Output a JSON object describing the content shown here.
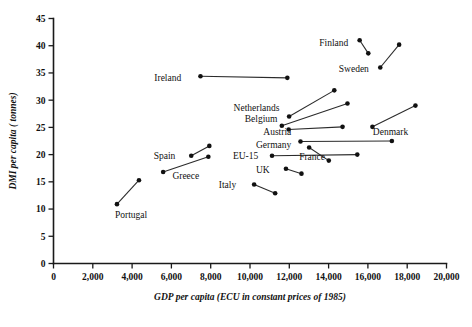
{
  "chart_data": {
    "type": "scatter",
    "title": "",
    "xlabel": "GDP per capita (ECU in constant prices of 1985)",
    "ylabel": "DMI per capita ( tonnes)",
    "xlim": [
      0,
      20000
    ],
    "ylim": [
      0,
      45
    ],
    "grid": false,
    "legend": "none",
    "xticks": [
      0,
      2000,
      4000,
      6000,
      8000,
      10000,
      12000,
      14000,
      16000,
      18000,
      20000
    ],
    "xticklabels": [
      "0",
      "2,000",
      "4,000",
      "6,000",
      "8,000",
      "10,000",
      "12,000",
      "14,000",
      "16,000",
      "18,000",
      "20,000"
    ],
    "yticks": [
      0,
      5,
      10,
      15,
      20,
      25,
      30,
      35,
      40,
      45
    ],
    "yticklabels": [
      "0",
      "5",
      "10",
      "15",
      "20",
      "25",
      "30",
      "35",
      "40",
      "45"
    ],
    "note": "Each country is drawn as a two-point segment connecting its start-year and end-year values.",
    "series": [
      {
        "name": "Finland",
        "label": "Finland",
        "label_side": "left",
        "label_x": 15000,
        "label_y": 40.6,
        "points": [
          {
            "x": 15580,
            "y": 41.0
          },
          {
            "x": 16020,
            "y": 38.6
          }
        ]
      },
      {
        "name": "Sweden",
        "label": "Sweden",
        "label_side": "left",
        "label_x": 16050,
        "label_y": 35.8,
        "points": [
          {
            "x": 16630,
            "y": 36.0
          },
          {
            "x": 17590,
            "y": 40.2
          }
        ]
      },
      {
        "name": "Ireland",
        "label": "Ireland",
        "label_side": "left",
        "label_x": 6500,
        "label_y": 34.2,
        "points": [
          {
            "x": 7480,
            "y": 34.4
          },
          {
            "x": 11900,
            "y": 34.1
          }
        ]
      },
      {
        "name": "Netherlands",
        "label": "Netherlands",
        "label_side": "left",
        "label_x": 11500,
        "label_y": 28.6,
        "points": [
          {
            "x": 11990,
            "y": 27.0
          },
          {
            "x": 14290,
            "y": 31.8
          }
        ]
      },
      {
        "name": "Belgium",
        "label": "Belgium",
        "label_side": "left",
        "label_x": 11400,
        "label_y": 26.6,
        "points": [
          {
            "x": 11620,
            "y": 25.3
          },
          {
            "x": 14960,
            "y": 29.4
          }
        ]
      },
      {
        "name": "Austria",
        "label": "Austria",
        "label_side": "left",
        "label_x": 12100,
        "label_y": 24.2,
        "points": [
          {
            "x": 11970,
            "y": 24.6
          },
          {
            "x": 14710,
            "y": 25.1
          }
        ]
      },
      {
        "name": "Denmark",
        "label": "Denmark",
        "label_side": "below",
        "label_x": 17150,
        "label_y": 24.2,
        "points": [
          {
            "x": 16230,
            "y": 25.1
          },
          {
            "x": 18420,
            "y": 29.0
          }
        ]
      },
      {
        "name": "Germany",
        "label": "Germany",
        "label_side": "left",
        "label_x": 12100,
        "label_y": 21.8,
        "points": [
          {
            "x": 12570,
            "y": 22.4
          },
          {
            "x": 17220,
            "y": 22.5
          }
        ]
      },
      {
        "name": "EU-15",
        "label": "EU-15",
        "label_side": "left",
        "label_x": 10420,
        "label_y": 19.8,
        "points": [
          {
            "x": 11120,
            "y": 19.8
          },
          {
            "x": 15460,
            "y": 20.0
          }
        ]
      },
      {
        "name": "France",
        "label": "France",
        "label_side": "right",
        "label_x": 12500,
        "label_y": 19.7,
        "points": [
          {
            "x": 13010,
            "y": 21.3
          },
          {
            "x": 14010,
            "y": 18.9
          }
        ]
      },
      {
        "name": "UK",
        "label": "UK",
        "label_side": "left",
        "label_x": 11000,
        "label_y": 17.3,
        "points": [
          {
            "x": 11830,
            "y": 17.4
          },
          {
            "x": 12620,
            "y": 16.5
          }
        ]
      },
      {
        "name": "Italy",
        "label": "Italy",
        "label_side": "left",
        "label_x": 9300,
        "label_y": 14.5,
        "points": [
          {
            "x": 10210,
            "y": 14.5
          },
          {
            "x": 11280,
            "y": 12.9
          }
        ]
      },
      {
        "name": "Spain",
        "label": "Spain",
        "label_side": "left",
        "label_x": 6200,
        "label_y": 19.8,
        "points": [
          {
            "x": 7010,
            "y": 19.8
          },
          {
            "x": 7930,
            "y": 21.6
          }
        ]
      },
      {
        "name": "Greece",
        "label": "Greece",
        "label_side": "right",
        "label_x": 6050,
        "label_y": 16.2,
        "points": [
          {
            "x": 5580,
            "y": 16.8
          },
          {
            "x": 7880,
            "y": 19.6
          }
        ]
      },
      {
        "name": "Portugal",
        "label": "Portugal",
        "label_side": "below",
        "label_x": 3950,
        "label_y": 9.0,
        "points": [
          {
            "x": 3230,
            "y": 10.9
          },
          {
            "x": 4350,
            "y": 15.3
          }
        ]
      }
    ]
  }
}
